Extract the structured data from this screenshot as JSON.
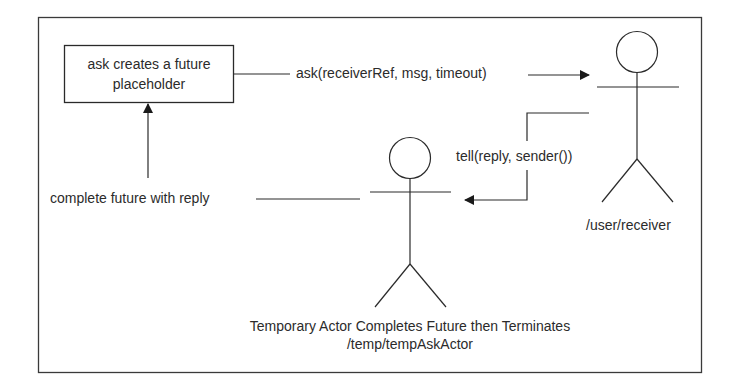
{
  "diagram": {
    "type": "actor-message-flow",
    "future_box": {
      "line1": "ask creates a future",
      "line2": "placeholder"
    },
    "messages": {
      "ask": "ask(receiverRef, msg, timeout)",
      "tell": "tell(reply, sender())",
      "complete": "complete future with reply"
    },
    "actors": {
      "receiver": {
        "label": "/user/receiver"
      },
      "temporary": {
        "title": "Temporary Actor Completes Future then Terminates",
        "path": "/temp/tempAskActor"
      }
    },
    "colors": {
      "stroke": "#2a2a2a",
      "background": "#ffffff"
    }
  }
}
